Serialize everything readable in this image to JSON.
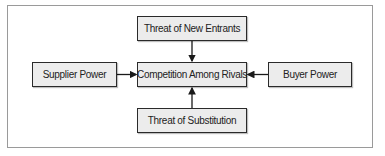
{
  "diagram": {
    "title": "",
    "nodes": [
      {
        "id": "new_entrants",
        "label": "Threat of New Entrants"
      },
      {
        "id": "rivals",
        "label": "Competition Among Rivals"
      },
      {
        "id": "supplier",
        "label": "Supplier Power"
      },
      {
        "id": "buyer",
        "label": "Buyer Power"
      },
      {
        "id": "substitution",
        "label": "Threat of Substitution"
      }
    ],
    "edges": [
      {
        "from": "new_entrants",
        "to": "rivals"
      },
      {
        "from": "supplier",
        "to": "rivals"
      },
      {
        "from": "buyer",
        "to": "rivals"
      },
      {
        "from": "substitution",
        "to": "rivals"
      }
    ],
    "colors": {
      "box_fill": "#ececec",
      "box_border": "#2a2a2a",
      "frame_border": "#9a9a9a",
      "arrow": "#1a1a1a"
    }
  }
}
